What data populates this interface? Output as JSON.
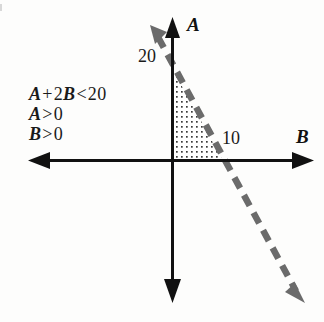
{
  "figure": {
    "kind": "math-graph",
    "background_color": "#fdfdfc"
  },
  "constraints": {
    "lines": [
      {
        "id": "c1",
        "var1": "A",
        "plus": "+",
        "coef2": "2",
        "var2": "B",
        "relation": "<",
        "value": "20",
        "text": "A + 2B < 20"
      },
      {
        "id": "c2",
        "var1": "A",
        "relation": ">",
        "value": "0",
        "text": "A > 0"
      },
      {
        "id": "c3",
        "var1": "B",
        "relation": ">",
        "value": "0",
        "text": "B > 0"
      }
    ]
  },
  "axes": {
    "vertical": {
      "label": "A",
      "color": "#111111",
      "origin_px": [
        172,
        160
      ],
      "tip_px": [
        172,
        20
      ],
      "tail_px": [
        172,
        300
      ]
    },
    "horizontal": {
      "label": "B",
      "color": "#111111",
      "origin_px": [
        172,
        160
      ],
      "tip_px": [
        314,
        160
      ],
      "tail_px": [
        28,
        160
      ]
    }
  },
  "ticks": [
    {
      "label": "20",
      "axis": "A",
      "value": 20,
      "at_px": [
        172,
        70
      ]
    },
    {
      "label": "10",
      "axis": "B",
      "value": 10,
      "at_px": [
        222,
        160
      ]
    }
  ],
  "boundary_line": {
    "equation": "A + 2B = 20",
    "style": "dashed",
    "color": "#6b6b6b",
    "stroke_width": 6,
    "dash_pattern": "11 8",
    "from_px": [
      152,
      28
    ],
    "intercept_A_px": [
      172,
      70
    ],
    "intercept_B_px": [
      223,
      160
    ],
    "to_px": [
      300,
      296
    ],
    "arrow_start": "up-left",
    "arrow_end": "down-right"
  },
  "shaded_region": {
    "name": "feasible-region",
    "fill": "dotted",
    "dot_color": "#3a3a3a",
    "dot_spacing_px": 5,
    "vertices_px": [
      [
        172,
        70
      ],
      [
        172,
        160
      ],
      [
        223,
        160
      ]
    ],
    "vertices_math": [
      [
        0,
        20
      ],
      [
        0,
        0
      ],
      [
        10,
        0
      ]
    ]
  }
}
